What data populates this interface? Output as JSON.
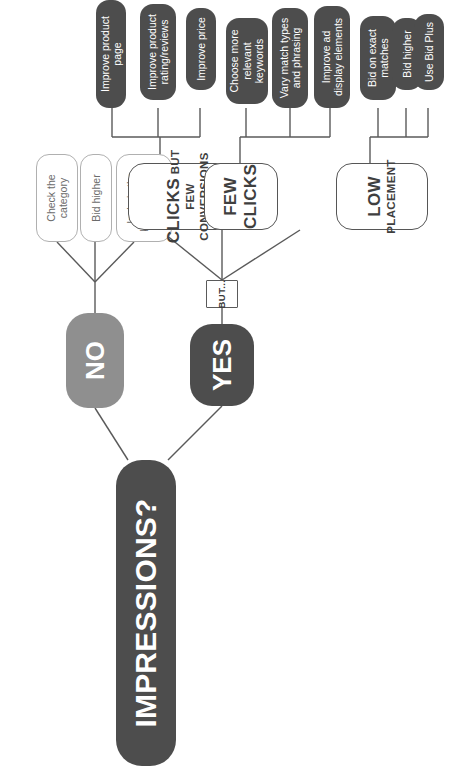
{
  "diagram": {
    "title": "IMPRESSIONS?",
    "type": "flowchart",
    "orientation": "rotated-90-ccw",
    "colors": {
      "root_fill": "#4d4d4d",
      "no_fill": "#8f8f8f",
      "yes_fill": "#4d4d4d",
      "action_fill": "#4d4d4d",
      "light_outline": "#b0b0b0",
      "dark_outline": "#565656",
      "text_on_dark": "#ffffff",
      "wire": "#5a5a5a",
      "background": "#ffffff"
    },
    "root": {
      "label": "IMPRESSIONS?"
    },
    "branches": [
      {
        "id": "no",
        "label": "NO",
        "style": "answer-no",
        "children": [
          {
            "id": "no-1",
            "label": "Check the\ncategory",
            "style": "suggest-light"
          },
          {
            "id": "no-2",
            "label": "Bid higher",
            "style": "suggest-light"
          },
          {
            "id": "no-3",
            "label": "Include the\nkeyword in the\nproduct page",
            "style": "suggest-light"
          }
        ]
      },
      {
        "id": "yes",
        "label": "YES",
        "style": "answer-yes",
        "connector": {
          "id": "but",
          "label": "BUT..."
        },
        "children": [
          {
            "id": "clicks-few-conversions",
            "label_main": "CLICKS",
            "label_but": "BUT",
            "label_sub": "FEW CONVERSIONS",
            "style": "symptom",
            "children": [
              {
                "id": "cfc-1",
                "label": "Improve product page",
                "style": "action"
              },
              {
                "id": "cfc-2",
                "label": "Improve product\nrating/reviews",
                "style": "action"
              },
              {
                "id": "cfc-3",
                "label": "Improve price",
                "style": "action"
              }
            ]
          },
          {
            "id": "few-clicks",
            "label_main": "FEW",
            "label_sub": "CLICKS",
            "style": "symptom",
            "children": [
              {
                "id": "fc-1",
                "label": "Choose more\nrelevant\nkeywords",
                "style": "action"
              },
              {
                "id": "fc-2",
                "label": "Vary match types\nand phrasing",
                "style": "action"
              },
              {
                "id": "fc-3",
                "label": "Improve ad\ndisplay elements",
                "style": "action"
              }
            ]
          },
          {
            "id": "low-placement",
            "label_main": "LOW",
            "label_sub": "PLACEMENT",
            "style": "symptom",
            "children": [
              {
                "id": "lp-1",
                "label": "Bid on exact\nmatches",
                "style": "action"
              },
              {
                "id": "lp-2",
                "label": "Bid higher",
                "style": "action"
              },
              {
                "id": "lp-3",
                "label": "Use Bid Plus",
                "style": "action"
              }
            ]
          }
        ]
      }
    ]
  }
}
